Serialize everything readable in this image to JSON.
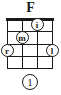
{
  "diagram": {
    "title": "F",
    "instrument_strings": 4,
    "fret_count": 4,
    "colors": {
      "ink": "#1a1a1a",
      "paper": "#ffffff"
    },
    "nut": {
      "visible": true,
      "label": "nut"
    },
    "strings": [
      {
        "index": 1,
        "x": 0
      },
      {
        "index": 2,
        "x": 15
      },
      {
        "index": 3,
        "x": 30
      },
      {
        "index": 4,
        "x": 45
      }
    ],
    "frets": [
      {
        "index": 1,
        "y": 13
      },
      {
        "index": 2,
        "y": 26
      },
      {
        "index": 3,
        "y": 38
      },
      {
        "index": 4,
        "y": 50
      }
    ],
    "markers": [
      {
        "id": "marker-i",
        "label": "i",
        "finger": "index",
        "string": 3,
        "fret": 1,
        "x": 30,
        "y": 6
      },
      {
        "id": "marker-m",
        "label": "m",
        "finger": "middle",
        "string": 2,
        "fret": 2,
        "x": 15,
        "y": 19
      },
      {
        "id": "marker-r",
        "label": "r",
        "finger": "ring",
        "string": 1,
        "fret": 3,
        "x": 0,
        "y": 32
      },
      {
        "id": "marker-l",
        "label": "l",
        "finger": "little",
        "string": 4,
        "fret": 3,
        "x": 45,
        "y": 32
      }
    ],
    "position_marker": {
      "label": "1",
      "meaning": "starting fret position"
    }
  }
}
